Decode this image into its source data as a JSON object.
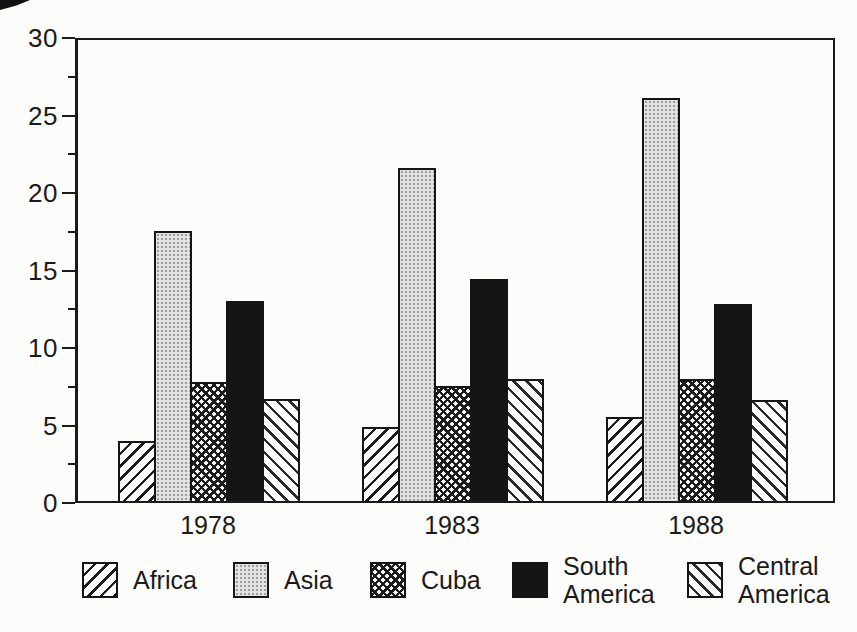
{
  "figure": {
    "background_color": "#fcfcfb",
    "ink_color": "#1a1a1a",
    "asia_fill_color": "#e3e3e2"
  },
  "chart_data": {
    "type": "bar",
    "title": "",
    "xlabel": "",
    "ylabel": "",
    "categories": [
      "1978",
      "1983",
      "1988"
    ],
    "series": [
      {
        "name": "Africa",
        "pattern": "diagonal-hatch-forward",
        "values": [
          3.9,
          4.8,
          5.4
        ]
      },
      {
        "name": "Asia",
        "pattern": "gray-halftone-dots",
        "values": [
          17.4,
          21.5,
          26.0
        ]
      },
      {
        "name": "Cuba",
        "pattern": "crosshatch",
        "values": [
          7.7,
          7.4,
          7.9
        ]
      },
      {
        "name": "South America",
        "pattern": "solid-black",
        "values": [
          12.9,
          14.3,
          12.7
        ]
      },
      {
        "name": "Central America",
        "pattern": "diagonal-hatch-backward",
        "values": [
          6.6,
          7.9,
          6.5
        ]
      }
    ],
    "ylim": [
      0,
      30
    ],
    "y_major_ticks": [
      "0",
      "5",
      "10",
      "15",
      "20",
      "25",
      "30"
    ],
    "y_minor_tick_values": [
      2.5,
      7.5,
      12.5,
      17.5,
      22.5,
      27.5
    ],
    "grid": false,
    "legend_position": "bottom",
    "legend_labels": [
      "Africa",
      "Asia",
      "Cuba",
      "South\nAmerica",
      "Central\nAmerica"
    ]
  }
}
